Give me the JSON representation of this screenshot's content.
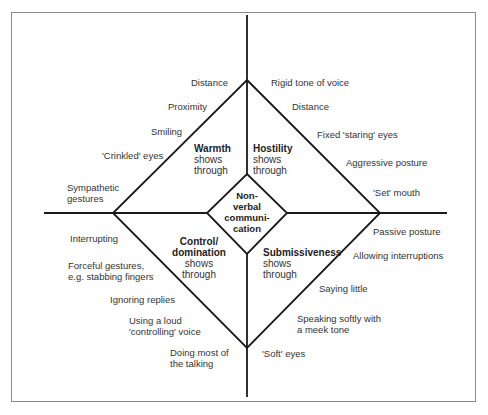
{
  "center": {
    "lines": [
      "Non-",
      "verbal",
      "communi-",
      "cation"
    ]
  },
  "quadrants": {
    "warmth": {
      "title": "Warmth",
      "sub1": "shows",
      "sub2": "through"
    },
    "hostility": {
      "title": "Hostility",
      "sub1": "shows",
      "sub2": "through"
    },
    "control": {
      "title1": "Control/",
      "title2": "domination",
      "sub1": "shows",
      "sub2": "through"
    },
    "submissiveness": {
      "title": "Submissiveness",
      "sub1": "shows",
      "sub2": "through"
    }
  },
  "warmth_cues": [
    "Distance",
    "Proximity",
    "Smiling",
    "'Crinkled' eyes",
    "Sympathetic",
    "gestures"
  ],
  "hostility_cues": [
    "Rigid tone of voice",
    "Distance",
    "Fixed 'staring' eyes",
    "Aggressive posture",
    "'Set' mouth"
  ],
  "control_cues": [
    "Interrupting",
    "Forceful gestures,",
    "e.g. stabbing fingers",
    "Ignoring replies",
    "Using a loud",
    "'controlling' voice",
    "Doing most of",
    "the talking"
  ],
  "submissive_cues": [
    "Passive posture",
    "Allowing interruptions",
    "Saying little",
    "Speaking softly with",
    "a meek tone",
    "'Soft' eyes"
  ],
  "colors": {
    "line": "#1a1a1a",
    "frame": "#8a8a8a",
    "text": "#333333"
  }
}
